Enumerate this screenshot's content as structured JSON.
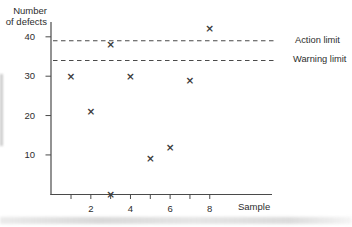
{
  "chart_data": {
    "type": "scatter",
    "title": "",
    "ylabel": "Number of defects",
    "ylabel_lines": [
      "Number",
      "of defects"
    ],
    "xlabel": "Sample",
    "marker_glyph": "×",
    "points": [
      {
        "sample": 1,
        "defects": 30
      },
      {
        "sample": 2,
        "defects": 21
      },
      {
        "sample": 3,
        "defects": 38
      },
      {
        "sample": 3,
        "defects": 0
      },
      {
        "sample": 4,
        "defects": 30
      },
      {
        "sample": 5,
        "defects": 9
      },
      {
        "sample": 6,
        "defects": 12
      },
      {
        "sample": 7,
        "defects": 29
      },
      {
        "sample": 8,
        "defects": 42
      }
    ],
    "limit_lines": [
      {
        "label": "Action limit",
        "value": 39,
        "style": "dashed"
      },
      {
        "label": "Warning limit",
        "value": 34,
        "style": "dashed"
      }
    ],
    "y_ticks": [
      40,
      30,
      20,
      10
    ],
    "x_ticks": [
      1,
      2,
      3,
      4,
      5,
      6,
      7,
      8
    ],
    "x_tick_labels": [
      2,
      4,
      6,
      8
    ],
    "ylim": [
      0,
      43.5
    ],
    "xlim": [
      0,
      11.2
    ],
    "grid": false,
    "legend": "none",
    "colors": {
      "axis": "#4a4a4a",
      "dashed": "#4a4a4a",
      "marker": "#3a3a3a",
      "text": "#2d2d2d",
      "background": "#ffffff"
    }
  }
}
